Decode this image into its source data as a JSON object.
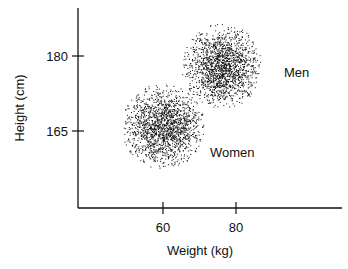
{
  "chart_data": {
    "type": "scatter",
    "title": "",
    "xlabel": "Weight (kg)",
    "ylabel": "Height (cm)",
    "xticks": [
      60,
      80
    ],
    "yticks": [
      165,
      180
    ],
    "xlim": [
      36,
      110
    ],
    "ylim": [
      142,
      194
    ],
    "grid": false,
    "legend": "none (direct labels on clusters)",
    "series": [
      {
        "name": "Men",
        "label": "Men",
        "center": {
          "weight": 76,
          "height": 178
        },
        "spread": {
          "weight": 9,
          "height": 6
        },
        "approx_range": {
          "weight": [
            66,
            88
          ],
          "height": [
            170,
            187
          ]
        }
      },
      {
        "name": "Women",
        "label": "Women",
        "center": {
          "weight": 60,
          "height": 166
        },
        "spread": {
          "weight": 8,
          "height": 6
        },
        "approx_range": {
          "weight": [
            49,
            72
          ],
          "height": [
            157,
            174
          ]
        }
      }
    ]
  },
  "labels": {
    "xlabel": "Weight (kg)",
    "ylabel": "Height (cm)",
    "xtick_60": "60",
    "xtick_80": "80",
    "ytick_180": "180",
    "ytick_165": "165",
    "men": "Men",
    "women": "Women"
  }
}
